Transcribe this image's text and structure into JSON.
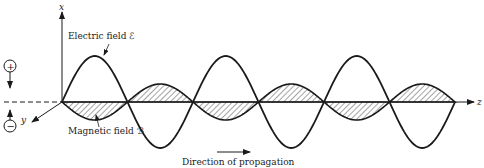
{
  "diagram": {
    "labels": {
      "x_axis": "x",
      "y_axis": "y",
      "z_axis": "z",
      "electric_field": "Electric field ℰ",
      "magnetic_field": "Magnetic field ℬ",
      "direction": "Direction of propagation",
      "plus_charge": "+",
      "minus_charge": "−"
    },
    "colors": {
      "ink": "#1a1a1a",
      "background": "#ffffff"
    },
    "wave": {
      "axis_y": 102,
      "origin_x": 62,
      "half_period_px": 65.5,
      "electric_amplitude_px": 46,
      "magnetic_amplitude_px": 18,
      "half_cycles": 6
    }
  }
}
